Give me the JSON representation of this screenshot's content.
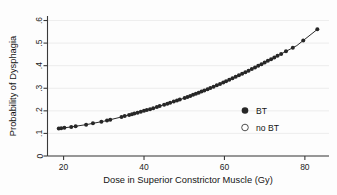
{
  "chart_data": {
    "type": "line",
    "title": "",
    "xlabel": "Dose in Superior Constrictor Muscle (Gy)",
    "ylabel": "Probability of Dysphagia",
    "xlim": [
      16,
      86
    ],
    "ylim": [
      0,
      0.62
    ],
    "xticks": [
      20,
      40,
      60,
      80
    ],
    "xtick_labels": [
      "20",
      "40",
      "60",
      "80"
    ],
    "yticks": [
      0,
      0.1,
      0.2,
      0.3,
      0.4,
      0.5,
      0.6
    ],
    "ytick_labels": [
      "0",
      ".1",
      ".2",
      ".3",
      ".4",
      ".5",
      ".6"
    ],
    "grid": "horizontal",
    "legend_position": "center-right",
    "legend": [
      {
        "label": "BT",
        "marker": "filled-circle",
        "color": "#272727"
      },
      {
        "label": "no BT",
        "marker": "open-circle",
        "color": "#ffffff"
      }
    ],
    "series": [
      {
        "name": "BT",
        "marker": "filled-circle",
        "x": [
          18.8,
          19.4,
          20.2,
          21.9,
          23.0,
          25.6,
          27.3,
          29.4,
          30.8,
          31.6,
          34.4,
          35.2,
          36.3,
          37.0,
          37.6,
          38.4,
          39.2,
          40.0,
          40.7,
          41.5,
          42.3,
          43.2,
          43.9,
          45.0,
          45.8,
          46.5,
          47.4,
          48.2,
          48.9,
          50.1,
          50.8,
          51.5,
          52.2,
          52.9,
          53.6,
          54.3,
          55.0,
          55.8,
          56.5,
          57.3,
          58.1,
          58.9,
          59.7,
          60.4,
          61.2,
          62.0,
          62.8,
          63.6,
          64.4,
          65.2,
          66.0,
          66.8,
          67.6,
          68.4,
          69.2,
          70.0,
          70.8,
          71.6,
          72.4,
          73.2,
          74.1,
          75.3,
          77.0,
          79.6,
          83.1
        ],
        "y": [
          0.122,
          0.123,
          0.125,
          0.129,
          0.132,
          0.139,
          0.145,
          0.152,
          0.157,
          0.16,
          0.172,
          0.176,
          0.181,
          0.184,
          0.187,
          0.191,
          0.195,
          0.199,
          0.203,
          0.207,
          0.211,
          0.216,
          0.22,
          0.226,
          0.231,
          0.235,
          0.24,
          0.245,
          0.249,
          0.257,
          0.262,
          0.266,
          0.271,
          0.276,
          0.281,
          0.286,
          0.291,
          0.297,
          0.302,
          0.308,
          0.314,
          0.32,
          0.326,
          0.332,
          0.338,
          0.345,
          0.351,
          0.358,
          0.365,
          0.371,
          0.378,
          0.385,
          0.392,
          0.399,
          0.406,
          0.414,
          0.421,
          0.428,
          0.436,
          0.443,
          0.451,
          0.463,
          0.479,
          0.505,
          0.541
        ]
      },
      {
        "name": "no BT",
        "marker": "open-circle",
        "x": [],
        "y": []
      }
    ],
    "fit_line": {
      "name": "fitted-probability-curve",
      "x": [
        18.5,
        22,
        26,
        30,
        34,
        38,
        42,
        46,
        50,
        54,
        58,
        62,
        66,
        70,
        74,
        78,
        83.4
      ],
      "y": [
        0.121,
        0.129,
        0.14,
        0.154,
        0.171,
        0.19,
        0.21,
        0.233,
        0.256,
        0.283,
        0.312,
        0.344,
        0.378,
        0.414,
        0.451,
        0.489,
        0.565
      ]
    }
  },
  "axes": {
    "ylabel": "Probability of Dysphagia",
    "xlabel": "Dose in Superior Constrictor Muscle (Gy)"
  },
  "legend": {
    "bt_label": "BT",
    "nobt_label": "no BT"
  }
}
